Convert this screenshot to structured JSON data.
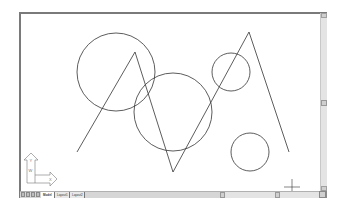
{
  "app": "AutoCAD drawing area",
  "tabs": [
    {
      "label": "Model",
      "active": true
    },
    {
      "label": "Layout1",
      "active": false
    },
    {
      "label": "Layout2",
      "active": false
    }
  ],
  "ucs_icon": {
    "y_label": "Y",
    "x_label": "X",
    "w_label": "W"
  },
  "drawing": {
    "stroke_color": "#333333",
    "circles": [
      {
        "cx": 116,
        "cy": 72,
        "r": 39
      },
      {
        "cx": 173,
        "cy": 112,
        "r": 39
      },
      {
        "cx": 231,
        "cy": 72,
        "r": 19
      },
      {
        "cx": 250,
        "cy": 152,
        "r": 19
      }
    ],
    "polyline": "77,152 135,52 173,172 249,32 289,152",
    "crosshair": {
      "x": 292,
      "y": 187
    }
  }
}
